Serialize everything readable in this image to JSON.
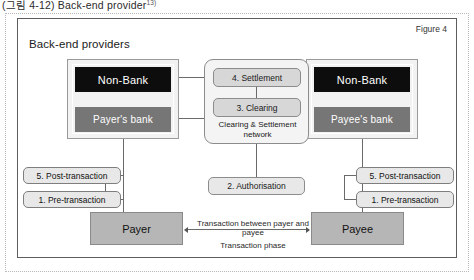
{
  "caption": {
    "text": "(그림 4-12)  Back-end provider",
    "superscript": "13)"
  },
  "figure": {
    "label": "Figure 4",
    "title": "Back-end providers"
  },
  "bank_groups": [
    {
      "side": "left",
      "nonbank_label": "Non-Bank",
      "bank_label": "Payer's bank"
    },
    {
      "side": "right",
      "nonbank_label": "Non-Bank",
      "bank_label": "Payee's bank"
    }
  ],
  "network": {
    "settlement_label": "4. Settlement",
    "clearing_label": "3. Clearing",
    "caption": "Clearing & Settlement network"
  },
  "authorisation": {
    "label": "2. Authorisation"
  },
  "phases": {
    "left_post": "5. Post-transaction",
    "left_pre": "1. Pre-transaction",
    "right_post": "5. Post-transaction",
    "right_pre": "1. Pre-transaction"
  },
  "actors": {
    "payer": "Payer",
    "payee": "Payee",
    "transaction_label": "Transaction between payer and payee",
    "phase_label": "Transaction phase"
  },
  "colors": {
    "nonbank_fill": "#0d0d0d",
    "bank_fill": "#767676",
    "actor_fill": "#b6b6b6",
    "network_fill": "#f4f4f4",
    "panel_border": "#5d5d5d"
  }
}
